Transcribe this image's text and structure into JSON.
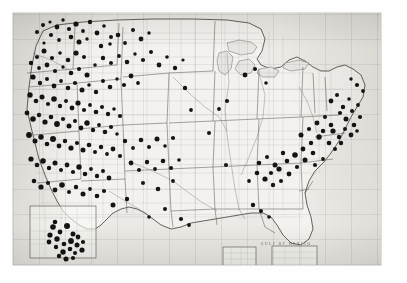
{
  "figure": {
    "title": "Dot distribution map of the United States",
    "medium": "halftone-printed map plate",
    "background_color": "#fefefe",
    "paper_color": "#eceae6",
    "ink_color": "#141312",
    "plate": {
      "left": 13,
      "top": 13,
      "width": 368,
      "height": 252
    }
  },
  "map": {
    "region": "Contiguous United States",
    "projection_note": "conic, with graticule net printed across sheet",
    "base_features": [
      "coastline",
      "state boundaries",
      "county boundaries",
      "rivers",
      "Great Lakes"
    ],
    "water_labels": [
      {
        "text": "GULF OF MEXICO",
        "x": 262,
        "y": 232,
        "size": 3.4
      }
    ],
    "insets": [
      {
        "name": "southern-california-inset",
        "x": 30,
        "y": 206,
        "width": 66,
        "height": 52
      },
      {
        "name": "gulf-inset-left",
        "x": 223,
        "y": 247,
        "width": 33,
        "height": 19
      },
      {
        "name": "gulf-inset-right",
        "x": 272,
        "y": 246,
        "width": 45,
        "height": 20
      }
    ]
  },
  "chart_data": {
    "type": "scatter",
    "title": "Dot distribution map of the United States",
    "xlabel": "",
    "ylabel": "",
    "marker": "filled circle",
    "marker_color": "#141312",
    "symbol_meaning": "one dot = one recorded location",
    "total_points": 247,
    "xlim": [
      0,
      368
    ],
    "ylim": [
      0,
      252
    ],
    "grid": true,
    "legend": "none",
    "density_summary": [
      {
        "region": "California (Central Valley, coast & Sierra foothills)",
        "density": "very high",
        "approx_points": 62
      },
      {
        "region": "Pacific Northwest (Washington, Oregon, Idaho)",
        "density": "high",
        "approx_points": 44
      },
      {
        "region": "Northern Rockies / Montana / Wyoming",
        "density": "moderate",
        "approx_points": 26
      },
      {
        "region": "Utah, Nevada, Colorado",
        "density": "moderate",
        "approx_points": 22
      },
      {
        "region": "Arizona / New Mexico",
        "density": "low-moderate",
        "approx_points": 14
      },
      {
        "region": "Great Plains (Dakotas, Nebraska, Kansas, Oklahoma, Texas)",
        "density": "very low",
        "approx_points": 7
      },
      {
        "region": "Southern Appalachians / Piedmont (Georgia, Carolinas, Tennessee)",
        "density": "high",
        "approx_points": 34
      },
      {
        "region": "Northeast corridor (Pennsylvania, New Jersey, New York, New England)",
        "density": "moderate-high",
        "approx_points": 19
      },
      {
        "region": "Great Lakes (Michigan, Wisconsin, Minnesota)",
        "density": "low",
        "approx_points": 6
      },
      {
        "region": "Gulf Coast (Louisiana, Alabama, Mississippi)",
        "density": "low",
        "approx_points": 5
      },
      {
        "region": "Southern California inset enlargement",
        "density": "very high",
        "approx_points": 21
      }
    ],
    "points": [
      [
        30,
        12,
        2.0
      ],
      [
        37,
        9,
        1.6
      ],
      [
        44,
        14,
        2.4
      ],
      [
        50,
        7,
        1.7
      ],
      [
        56,
        16,
        2.1
      ],
      [
        63,
        11,
        2.6
      ],
      [
        70,
        18,
        1.9
      ],
      [
        77,
        9,
        2.2
      ],
      [
        84,
        20,
        2.4
      ],
      [
        91,
        13,
        1.8
      ],
      [
        98,
        24,
        2.0
      ],
      [
        58,
        24,
        2.3
      ],
      [
        66,
        29,
        2.5
      ],
      [
        74,
        26,
        1.7
      ],
      [
        46,
        27,
        1.9
      ],
      [
        38,
        22,
        2.1
      ],
      [
        31,
        30,
        1.6
      ],
      [
        24,
        19,
        2.0
      ],
      [
        88,
        33,
        2.2
      ],
      [
        97,
        31,
        1.8
      ],
      [
        105,
        22,
        2.3
      ],
      [
        112,
        30,
        1.9
      ],
      [
        120,
        17,
        2.0
      ],
      [
        128,
        26,
        2.4
      ],
      [
        136,
        20,
        1.7
      ],
      [
        63,
        40,
        2.6
      ],
      [
        71,
        44,
        2.0
      ],
      [
        55,
        47,
        2.3
      ],
      [
        47,
        40,
        1.8
      ],
      [
        39,
        45,
        2.1
      ],
      [
        31,
        38,
        2.5
      ],
      [
        24,
        44,
        2.0
      ],
      [
        18,
        50,
        2.2
      ],
      [
        26,
        55,
        1.9
      ],
      [
        34,
        52,
        2.4
      ],
      [
        42,
        58,
        2.1
      ],
      [
        50,
        54,
        1.7
      ],
      [
        58,
        60,
        2.3
      ],
      [
        66,
        56,
        2.0
      ],
      [
        74,
        62,
        2.5
      ],
      [
        82,
        52,
        1.8
      ],
      [
        90,
        45,
        2.2
      ],
      [
        98,
        50,
        2.0
      ],
      [
        106,
        43,
        1.9
      ],
      [
        114,
        49,
        2.3
      ],
      [
        122,
        41,
        1.7
      ],
      [
        130,
        47,
        2.1
      ],
      [
        138,
        39,
        2.0
      ],
      [
        146,
        52,
        2.4
      ],
      [
        154,
        44,
        1.8
      ],
      [
        162,
        55,
        2.2
      ],
      [
        170,
        47,
        1.6
      ],
      [
        20,
        64,
        2.6
      ],
      [
        27,
        70,
        2.2
      ],
      [
        34,
        66,
        2.0
      ],
      [
        41,
        73,
        2.4
      ],
      [
        48,
        68,
        1.9
      ],
      [
        55,
        75,
        2.3
      ],
      [
        62,
        70,
        2.1
      ],
      [
        69,
        77,
        2.5
      ],
      [
        76,
        72,
        1.8
      ],
      [
        83,
        79,
        2.2
      ],
      [
        90,
        68,
        2.0
      ],
      [
        97,
        74,
        2.3
      ],
      [
        104,
        66,
        1.7
      ],
      [
        111,
        72,
        2.1
      ],
      [
        118,
        63,
        2.4
      ],
      [
        125,
        70,
        1.9
      ],
      [
        17,
        82,
        2.7
      ],
      [
        23,
        88,
        2.3
      ],
      [
        29,
        84,
        2.5
      ],
      [
        35,
        91,
        2.1
      ],
      [
        41,
        86,
        2.8
      ],
      [
        47,
        93,
        2.2
      ],
      [
        53,
        88,
        2.0
      ],
      [
        59,
        95,
        2.4
      ],
      [
        65,
        90,
        2.6
      ],
      [
        71,
        97,
        2.1
      ],
      [
        77,
        92,
        1.9
      ],
      [
        83,
        99,
        2.3
      ],
      [
        89,
        94,
        2.0
      ],
      [
        95,
        101,
        2.2
      ],
      [
        101,
        96,
        1.8
      ],
      [
        107,
        103,
        2.1
      ],
      [
        14,
        100,
        2.4
      ],
      [
        20,
        106,
        2.8
      ],
      [
        26,
        102,
        2.2
      ],
      [
        32,
        109,
        2.6
      ],
      [
        38,
        104,
        2.3
      ],
      [
        44,
        111,
        2.9
      ],
      [
        50,
        106,
        2.1
      ],
      [
        56,
        113,
        2.5
      ],
      [
        62,
        108,
        2.0
      ],
      [
        68,
        115,
        2.4
      ],
      [
        74,
        110,
        2.7
      ],
      [
        80,
        117,
        2.2
      ],
      [
        86,
        112,
        1.9
      ],
      [
        92,
        119,
        2.3
      ],
      [
        98,
        114,
        2.1
      ],
      [
        104,
        121,
        1.8
      ],
      [
        16,
        122,
        2.9
      ],
      [
        22,
        128,
        2.5
      ],
      [
        28,
        124,
        2.7
      ],
      [
        34,
        131,
        2.3
      ],
      [
        40,
        126,
        3.0
      ],
      [
        46,
        133,
        2.4
      ],
      [
        52,
        128,
        2.2
      ],
      [
        58,
        135,
        2.6
      ],
      [
        64,
        130,
        2.1
      ],
      [
        70,
        137,
        2.5
      ],
      [
        76,
        132,
        2.3
      ],
      [
        82,
        139,
        2.0
      ],
      [
        88,
        134,
        2.2
      ],
      [
        94,
        141,
        1.9
      ],
      [
        100,
        136,
        2.4
      ],
      [
        107,
        143,
        2.1
      ],
      [
        18,
        146,
        2.6
      ],
      [
        24,
        152,
        2.3
      ],
      [
        30,
        148,
        2.8
      ],
      [
        36,
        155,
        2.2
      ],
      [
        42,
        150,
        2.5
      ],
      [
        48,
        157,
        2.0
      ],
      [
        54,
        152,
        2.4
      ],
      [
        60,
        159,
        2.1
      ],
      [
        66,
        154,
        2.7
      ],
      [
        72,
        161,
        2.3
      ],
      [
        78,
        156,
        1.9
      ],
      [
        84,
        163,
        2.2
      ],
      [
        90,
        158,
        2.0
      ],
      [
        96,
        165,
        2.4
      ],
      [
        21,
        168,
        2.3
      ],
      [
        28,
        174,
        2.6
      ],
      [
        35,
        170,
        2.1
      ],
      [
        42,
        177,
        2.4
      ],
      [
        49,
        172,
        2.8
      ],
      [
        56,
        179,
        2.0
      ],
      [
        63,
        174,
        2.2
      ],
      [
        70,
        181,
        2.5
      ],
      [
        77,
        176,
        1.9
      ],
      [
        84,
        183,
        2.3
      ],
      [
        91,
        178,
        2.1
      ],
      [
        112,
        128,
        2.2
      ],
      [
        120,
        135,
        1.9
      ],
      [
        128,
        127,
        2.3
      ],
      [
        136,
        134,
        2.0
      ],
      [
        144,
        126,
        2.5
      ],
      [
        152,
        133,
        1.8
      ],
      [
        160,
        125,
        2.1
      ],
      [
        118,
        150,
        2.4
      ],
      [
        126,
        157,
        2.0
      ],
      [
        134,
        149,
        2.2
      ],
      [
        142,
        156,
        1.9
      ],
      [
        150,
        148,
        2.3
      ],
      [
        158,
        155,
        2.1
      ],
      [
        166,
        147,
        1.8
      ],
      [
        130,
        170,
        2.0
      ],
      [
        145,
        176,
        2.3
      ],
      [
        160,
        168,
        1.9
      ],
      [
        114,
        186,
        2.2
      ],
      [
        100,
        192,
        2.5
      ],
      [
        196,
        120,
        2.0
      ],
      [
        213,
        152,
        2.1
      ],
      [
        178,
        97,
        1.9
      ],
      [
        232,
        62,
        2.4
      ],
      [
        242,
        56,
        2.0
      ],
      [
        253,
        70,
        1.8
      ],
      [
        172,
        75,
        2.2
      ],
      [
        206,
        96,
        1.9
      ],
      [
        214,
        88,
        2.1
      ],
      [
        246,
        150,
        2.3
      ],
      [
        254,
        144,
        2.0
      ],
      [
        262,
        152,
        2.5
      ],
      [
        270,
        140,
        2.2
      ],
      [
        258,
        160,
        2.1
      ],
      [
        266,
        156,
        2.6
      ],
      [
        274,
        148,
        2.3
      ],
      [
        282,
        142,
        2.8
      ],
      [
        290,
        136,
        2.4
      ],
      [
        298,
        130,
        2.2
      ],
      [
        306,
        124,
        2.7
      ],
      [
        300,
        140,
        2.3
      ],
      [
        292,
        147,
        2.5
      ],
      [
        284,
        154,
        2.1
      ],
      [
        276,
        161,
        2.4
      ],
      [
        268,
        168,
        2.0
      ],
      [
        260,
        172,
        2.2
      ],
      [
        252,
        166,
        2.6
      ],
      [
        244,
        160,
        2.3
      ],
      [
        236,
        168,
        1.9
      ],
      [
        288,
        122,
        2.5
      ],
      [
        296,
        116,
        2.1
      ],
      [
        304,
        110,
        2.4
      ],
      [
        310,
        118,
        2.2
      ],
      [
        312,
        104,
        2.0
      ],
      [
        318,
        112,
        2.3
      ],
      [
        302,
        152,
        2.1
      ],
      [
        310,
        146,
        1.9
      ],
      [
        318,
        88,
        2.4
      ],
      [
        324,
        82,
        2.0
      ],
      [
        330,
        94,
        2.2
      ],
      [
        336,
        86,
        1.8
      ],
      [
        327,
        100,
        2.1
      ],
      [
        333,
        106,
        2.5
      ],
      [
        339,
        98,
        2.0
      ],
      [
        341,
        112,
        2.3
      ],
      [
        345,
        92,
        1.9
      ],
      [
        347,
        104,
        2.1
      ],
      [
        320,
        118,
        2.6
      ],
      [
        326,
        124,
        2.2
      ],
      [
        332,
        116,
        2.0
      ],
      [
        338,
        122,
        2.4
      ],
      [
        344,
        118,
        1.8
      ],
      [
        316,
        130,
        2.3
      ],
      [
        322,
        136,
        2.0
      ],
      [
        328,
        130,
        2.2
      ],
      [
        350,
        78,
        1.9
      ],
      [
        344,
        72,
        2.1
      ],
      [
        338,
        66,
        1.7
      ],
      [
        248,
        198,
        2.0
      ],
      [
        256,
        204,
        1.8
      ],
      [
        240,
        192,
        2.2
      ],
      [
        176,
        212,
        1.9
      ],
      [
        168,
        206,
        2.1
      ],
      [
        152,
        196,
        2.0
      ],
      [
        136,
        204,
        1.8
      ],
      [
        40,
        214,
        2.8
      ],
      [
        47,
        219,
        2.4
      ],
      [
        54,
        213,
        3.0
      ],
      [
        60,
        221,
        2.5
      ],
      [
        44,
        226,
        2.7
      ],
      [
        51,
        231,
        2.3
      ],
      [
        58,
        228,
        2.9
      ],
      [
        65,
        224,
        2.4
      ],
      [
        37,
        222,
        2.6
      ],
      [
        43,
        234,
        2.2
      ],
      [
        50,
        239,
        2.7
      ],
      [
        57,
        236,
        2.3
      ],
      [
        64,
        232,
        2.5
      ],
      [
        70,
        229,
        2.1
      ],
      [
        36,
        229,
        2.4
      ],
      [
        62,
        240,
        2.0
      ],
      [
        69,
        237,
        2.6
      ],
      [
        46,
        243,
        2.2
      ],
      [
        53,
        246,
        2.5
      ],
      [
        60,
        245,
        2.1
      ],
      [
        42,
        209,
        2.3
      ]
    ]
  }
}
